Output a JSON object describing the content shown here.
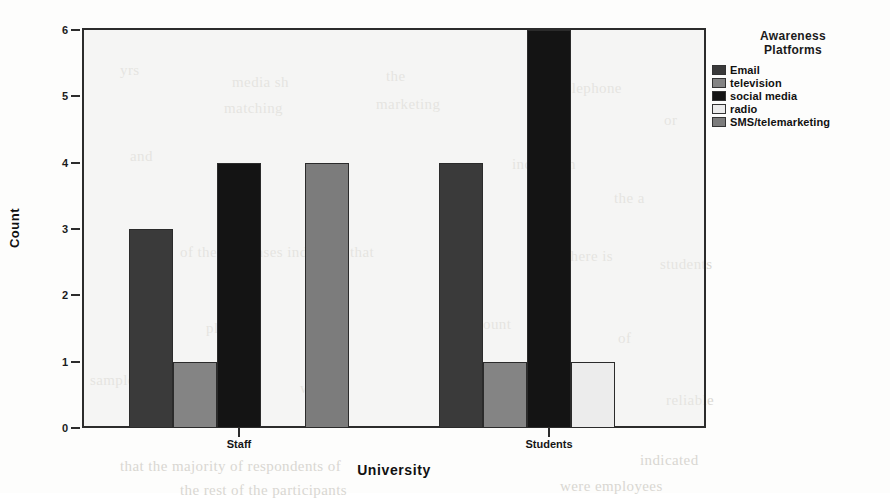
{
  "chart_data": {
    "type": "bar",
    "title": "",
    "xlabel": "University",
    "ylabel": "Count",
    "categories": [
      "Staff",
      "Students"
    ],
    "ylim": [
      0,
      6
    ],
    "yticks": [
      "0",
      "1",
      "2",
      "3",
      "4",
      "5",
      "6"
    ],
    "grid": false,
    "legend_position": "right",
    "legend_title": "Awareness\nPlatforms",
    "series": [
      {
        "name": "Email",
        "values": [
          3,
          4
        ],
        "color": "#3a3a3a"
      },
      {
        "name": "television",
        "values": [
          1,
          1
        ],
        "color": "#848484"
      },
      {
        "name": "social media",
        "values": [
          4,
          6
        ],
        "color": "#141414"
      },
      {
        "name": "radio",
        "values": [
          0,
          1
        ],
        "color": "#ececec"
      },
      {
        "name": "SMS/telemarketing",
        "values": [
          4,
          0
        ],
        "color": "#7c7c7c"
      }
    ]
  },
  "legend": {
    "title_line1": "Awareness",
    "title_line2": "Platforms",
    "items": [
      {
        "label": "Email",
        "color": "#3a3a3a"
      },
      {
        "label": "television",
        "color": "#848484"
      },
      {
        "label": "social media",
        "color": "#141414"
      },
      {
        "label": "radio",
        "color": "#ececec"
      },
      {
        "label": "SMS/telemarketing",
        "color": "#7c7c7c"
      }
    ]
  },
  "axes": {
    "y_title": "Count",
    "x_title": "University",
    "y_ticks": [
      "6",
      "5",
      "4",
      "3",
      "2",
      "1",
      "0"
    ],
    "x_ticks": [
      "Staff",
      "Students"
    ]
  },
  "background_text": [
    {
      "text": "yrs",
      "x": 120,
      "y": 62
    },
    {
      "text": "media sh",
      "x": 232,
      "y": 74
    },
    {
      "text": "the",
      "x": 386,
      "y": 68
    },
    {
      "text": "matching",
      "x": 224,
      "y": 100
    },
    {
      "text": "marketing",
      "x": 376,
      "y": 96
    },
    {
      "text": "telephone",
      "x": 560,
      "y": 80
    },
    {
      "text": "or",
      "x": 664,
      "y": 112
    },
    {
      "text": "and",
      "x": 130,
      "y": 148
    },
    {
      "text": "indication",
      "x": 512,
      "y": 156
    },
    {
      "text": "the a",
      "x": 614,
      "y": 190
    },
    {
      "text": "of the responses indicated that",
      "x": 180,
      "y": 244
    },
    {
      "text": "there is",
      "x": 566,
      "y": 248
    },
    {
      "text": "students",
      "x": 660,
      "y": 256
    },
    {
      "text": "platform",
      "x": 206,
      "y": 320
    },
    {
      "text": "count",
      "x": 476,
      "y": 316
    },
    {
      "text": "of",
      "x": 618,
      "y": 330
    },
    {
      "text": "sample",
      "x": 90,
      "y": 372
    },
    {
      "text": "was",
      "x": 300,
      "y": 380
    },
    {
      "text": "result",
      "x": 520,
      "y": 368
    },
    {
      "text": "reliable",
      "x": 666,
      "y": 392
    },
    {
      "text": "that the majority of respondents of",
      "x": 120,
      "y": 458
    },
    {
      "text": "indicated",
      "x": 640,
      "y": 452
    },
    {
      "text": "the rest of the participants",
      "x": 180,
      "y": 482
    },
    {
      "text": "were employees",
      "x": 560,
      "y": 478
    }
  ]
}
